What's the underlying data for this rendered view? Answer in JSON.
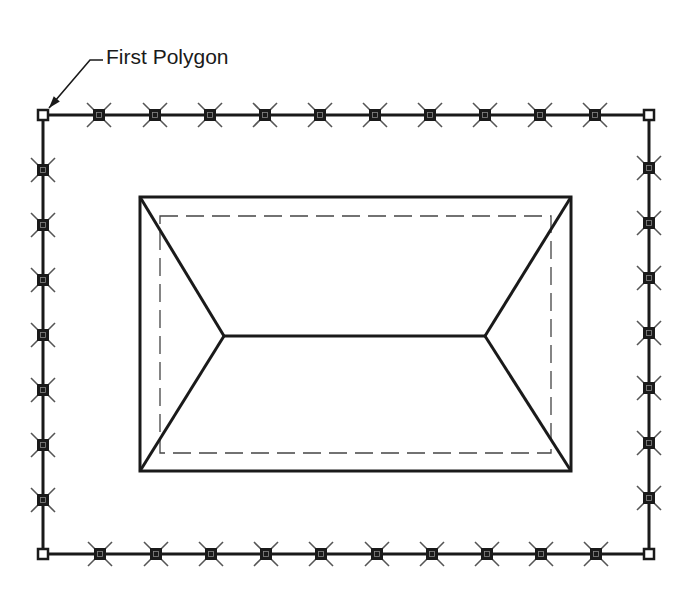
{
  "annotation": {
    "text": "First Polygon",
    "x": 106,
    "y": 45,
    "leader": [
      [
        103,
        60
      ],
      [
        90,
        60
      ],
      [
        49,
        108
      ]
    ]
  },
  "colors": {
    "line": "#1a1a1a",
    "background": "#ffffff",
    "marker_fill": "#1a1a1a",
    "cross": "#555555"
  },
  "outer_polygon": {
    "name": "first-polygon",
    "corners": [
      [
        43,
        115
      ],
      [
        649,
        115
      ],
      [
        649,
        554
      ],
      [
        43,
        554
      ]
    ],
    "stroke_width": 3,
    "top_markers_x": [
      99,
      155,
      210,
      265,
      320,
      375,
      430,
      485,
      540,
      595
    ],
    "bottom_markers_x": [
      100,
      156,
      211,
      266,
      321,
      377,
      432,
      487,
      541,
      596
    ],
    "left_markers_y": [
      170,
      225,
      280,
      335,
      390,
      445,
      500
    ],
    "right_markers_y": [
      168,
      223,
      278,
      333,
      388,
      443,
      498
    ]
  },
  "roof": {
    "outline": {
      "x1": 140,
      "y1": 197,
      "x2": 571,
      "y2": 471
    },
    "dashed_inset": {
      "x1": 160,
      "y1": 216,
      "x2": 551,
      "y2": 453
    },
    "ridge": [
      [
        224,
        336
      ],
      [
        485,
        336
      ]
    ]
  }
}
